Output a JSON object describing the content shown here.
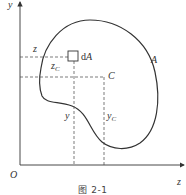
{
  "figure": {
    "caption": "图 2-1",
    "axes": {
      "vertical_label": "y",
      "horizontal_label": "z",
      "origin_label": "O"
    },
    "region_label": "A",
    "centroid_label": "C",
    "element": {
      "d": "d",
      "A": "A"
    },
    "coords": {
      "z": "z",
      "zc_base": "z",
      "zc_sub": "C",
      "y": "y",
      "yc_base": "y",
      "yc_sub": "C"
    },
    "colors": {
      "line": "#333333",
      "dashed": "#444444",
      "background": "#ffffff"
    }
  }
}
